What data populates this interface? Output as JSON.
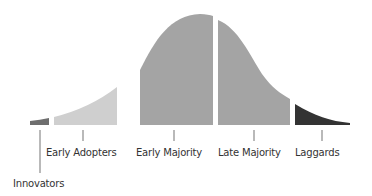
{
  "diagram": {
    "type": "diffusion-of-innovation-curve",
    "segments": [
      {
        "id": "innovators",
        "label": "Innovators",
        "color": "#6e6e6e"
      },
      {
        "id": "early-adopters",
        "label": "Early Adopters",
        "color": "#cfcfcf"
      },
      {
        "id": "early-majority",
        "label": "Early Majority",
        "color": "#a4a4a4"
      },
      {
        "id": "late-majority",
        "label": "Late Majority",
        "color": "#a4a4a4"
      },
      {
        "id": "laggards",
        "label": "Laggards",
        "color": "#333333"
      }
    ],
    "tick_color": "#8a8a8a",
    "label_color": "#333333"
  }
}
